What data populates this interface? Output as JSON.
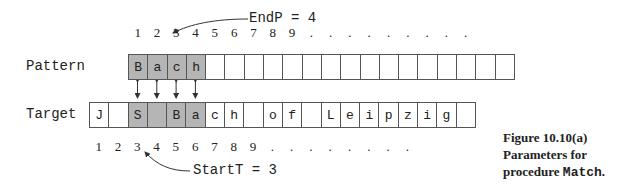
{
  "pattern": {
    "label": "Pattern",
    "cells": [
      "B",
      "a",
      "c",
      "h",
      "",
      "",
      "",
      "",
      "",
      "",
      "",
      "",
      "",
      "",
      "",
      "",
      "",
      "",
      "",
      ""
    ],
    "highlighted": [
      0,
      1,
      2,
      3
    ]
  },
  "target": {
    "label": "Target",
    "cells": [
      "J",
      "",
      "S",
      "",
      "B",
      "a",
      "c",
      "h",
      "",
      "o",
      "f",
      "",
      "L",
      "e",
      "i",
      "p",
      "z",
      "i",
      "g",
      ""
    ],
    "highlighted": [
      2,
      3,
      4,
      5
    ]
  },
  "top_indices": [
    "1",
    "2",
    "3",
    "4",
    "5",
    "6",
    "7",
    "8",
    "9",
    ".",
    ".",
    ".",
    ".",
    ".",
    ".",
    ".",
    ".",
    "."
  ],
  "bottom_indices": [
    "1",
    "2",
    "3",
    "4",
    "5",
    "6",
    "7",
    "8",
    "9",
    ".",
    ".",
    ".",
    ".",
    ".",
    ".",
    ".",
    "."
  ],
  "annotations": {
    "endp": "EndP  =  4",
    "startt": "StartT  =  3"
  },
  "caption": {
    "line1": "Figure 10.10(a)",
    "line2": "Parameters for",
    "line3_text": "procedure ",
    "line3_code": "Match",
    "line3_end": "."
  },
  "colors": {
    "highlight": "#b5b5b5",
    "border": "#555555",
    "text": "#222222"
  }
}
